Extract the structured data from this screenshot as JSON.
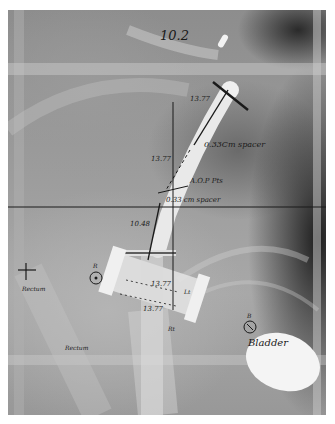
{
  "image": {
    "description": "Pelvic X-ray radiograph with brachytherapy applicator (tandem and ovoids) and handwritten annotations",
    "annotations": {
      "top_label": "10.2",
      "tandem_length_upper": "13.77",
      "spacer_upper": "0.33Cm spacer",
      "tandem_length_mid": "13.77",
      "dose_point_label": "A.O.P Pts",
      "spacer_lower": "0.33 cm spacer",
      "tandem_length_lower": "10.48",
      "ovoid_length_upper": "13.77",
      "ovoid_length_lower": "13.77",
      "rectum_marker_label": "R",
      "rectum_label_1": "Rectum",
      "rectum_label_2": "Rectum",
      "bladder_marker_label": "B",
      "bladder_label": "Bladder",
      "ovoid_right_label": "Rt",
      "ovoid_left_label": "Lt"
    },
    "colors": {
      "film_mid": "#9c9c9c",
      "film_dark": "#1e1e1e",
      "applicator": "#e8e8e8",
      "ink": "#1a1a1a"
    }
  }
}
